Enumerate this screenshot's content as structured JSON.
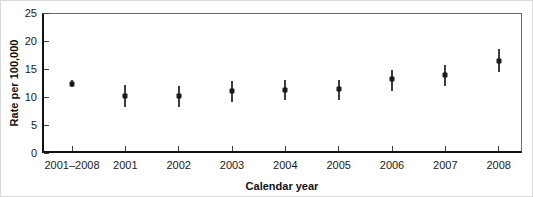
{
  "figure": {
    "background": "#ffffff",
    "frame_color": "#6a6a6a",
    "axis_color": "#111111",
    "tick_color": "#3d3d3d"
  },
  "chart_data": {
    "type": "scatter",
    "title": "",
    "xlabel": "Calendar year",
    "ylabel": "Rate per 100,000",
    "ylim": [
      0,
      25
    ],
    "yticks": [
      0,
      5,
      10,
      15,
      20,
      25
    ],
    "grid": false,
    "legend": null,
    "categories": [
      "2001–2008",
      "2001",
      "2002",
      "2003",
      "2004",
      "2005",
      "2006",
      "2007",
      "2008"
    ],
    "series": [
      {
        "name": "Rate per 100,000 with confidence interval",
        "marker": "square",
        "marker_color": "#1a1a1a",
        "error_bar_color": "#3d3d3d",
        "points": [
          {
            "x": "2001–2008",
            "y": 12.4,
            "ci_low": 11.7,
            "ci_high": 13.1
          },
          {
            "x": "2001",
            "y": 10.2,
            "ci_low": 8.3,
            "ci_high": 12.2
          },
          {
            "x": "2002",
            "y": 10.1,
            "ci_low": 8.2,
            "ci_high": 12.0
          },
          {
            "x": "2003",
            "y": 11.0,
            "ci_low": 9.1,
            "ci_high": 12.9
          },
          {
            "x": "2004",
            "y": 11.3,
            "ci_low": 9.4,
            "ci_high": 13.1
          },
          {
            "x": "2005",
            "y": 11.4,
            "ci_low": 9.5,
            "ci_high": 13.1
          },
          {
            "x": "2006",
            "y": 13.3,
            "ci_low": 11.1,
            "ci_high": 14.9
          },
          {
            "x": "2007",
            "y": 13.9,
            "ci_low": 11.9,
            "ci_high": 15.7
          },
          {
            "x": "2008",
            "y": 16.5,
            "ci_low": 14.5,
            "ci_high": 18.5
          }
        ]
      }
    ]
  }
}
